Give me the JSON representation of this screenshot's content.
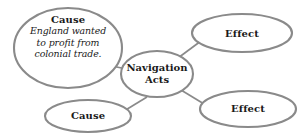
{
  "diagram": {
    "type": "cause-effect-concept-map",
    "background_color": "#ffffff",
    "stroke_color": "#8a8a8a",
    "text_color": "#1a1a1a",
    "center": {
      "id": "navigation-acts",
      "line1": "Navigation",
      "line2": "Acts"
    },
    "nodes": [
      {
        "id": "cause-main",
        "role": "cause",
        "title": "Cause",
        "body_line1": "England wanted",
        "body_line2": "to profit from",
        "body_line3": "colonial trade."
      },
      {
        "id": "cause-bottom",
        "role": "cause",
        "title": "Cause",
        "body_line1": "",
        "body_line2": "",
        "body_line3": ""
      },
      {
        "id": "effect-top",
        "role": "effect",
        "title": "Effect",
        "body_line1": "",
        "body_line2": "",
        "body_line3": ""
      },
      {
        "id": "effect-bottom",
        "role": "effect",
        "title": "Effect",
        "body_line1": "",
        "body_line2": "",
        "body_line3": ""
      }
    ],
    "connectors": [
      {
        "from": "cause-main",
        "to": "navigation-acts"
      },
      {
        "from": "cause-bottom",
        "to": "navigation-acts"
      },
      {
        "from": "navigation-acts",
        "to": "effect-top"
      },
      {
        "from": "navigation-acts",
        "to": "effect-bottom"
      }
    ]
  }
}
